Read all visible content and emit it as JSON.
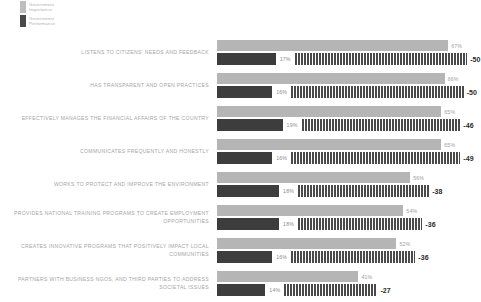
{
  "legend": {
    "items": [
      {
        "label": "Government\nImportance",
        "color": "#bdbdbd",
        "key": "importance"
      },
      {
        "label": "Government\nPerformance",
        "color": "#4a4a4a",
        "key": "performance"
      }
    ]
  },
  "chart_data": {
    "type": "bar",
    "title": "",
    "subtitle": "",
    "xlabel": "",
    "ylabel": "",
    "xlim": [
      0,
      70
    ],
    "grid": false,
    "legend_position": "top-left",
    "orientation": "horizontal",
    "value_suffix": "%",
    "categories": [
      "Listens to citizens' needs and feedback",
      "Has transparent and open practices",
      "Effectively manages the financial affairs of the country",
      "Communicates frequently and honestly",
      "Works to protect and improve the environment",
      "Provides national training programs to create employment opportunities",
      "Creates innovative programs that positively impact local communities",
      "Partners with business NGOs, and third parties to address societal issues"
    ],
    "series": [
      {
        "name": "Government Importance",
        "color": "#b5b5b5",
        "values": [
          67,
          66,
          65,
          65,
          56,
          54,
          52,
          41
        ]
      },
      {
        "name": "Government Performance",
        "color": "#3d3d3d",
        "values": [
          17,
          16,
          19,
          16,
          18,
          18,
          16,
          14
        ]
      },
      {
        "name": "Gap",
        "color": "#4a4a4a",
        "values": [
          -50,
          -50,
          -46,
          -49,
          -38,
          -36,
          -36,
          -27
        ]
      }
    ],
    "rows": [
      {
        "label": "LISTENS TO CITIZENS' NEEDS AND FEEDBACK",
        "importance": 67,
        "importance_label": "67%",
        "performance": 17,
        "performance_label": "17%",
        "gap": -50,
        "gap_label": "-50"
      },
      {
        "label": "HAS TRANSPARENT AND OPEN PRACTICES",
        "importance": 66,
        "importance_label": "66%",
        "performance": 16,
        "performance_label": "16%",
        "gap": -50,
        "gap_label": "-50"
      },
      {
        "label": "EFFECTIVELY MANAGES THE FINANCIAL AFFAIRS OF THE COUNTRY",
        "importance": 65,
        "importance_label": "65%",
        "performance": 19,
        "performance_label": "19%",
        "gap": -46,
        "gap_label": "-46"
      },
      {
        "label": "COMMUNICATES FREQUENTLY AND HONESTLY",
        "importance": 65,
        "importance_label": "65%",
        "performance": 16,
        "performance_label": "16%",
        "gap": -49,
        "gap_label": "-49"
      },
      {
        "label": "WORKS TO PROTECT AND IMPROVE THE ENVIRONMENT",
        "importance": 56,
        "importance_label": "56%",
        "performance": 18,
        "performance_label": "18%",
        "gap": -38,
        "gap_label": "-38"
      },
      {
        "label": "PROVIDES NATIONAL TRAINING PROGRAMS TO CREATE EMPLOYMENT OPPORTUNITIES",
        "importance": 54,
        "importance_label": "54%",
        "performance": 18,
        "performance_label": "18%",
        "gap": -36,
        "gap_label": "-36"
      },
      {
        "label": "CREATES INNOVATIVE PROGRAMS THAT POSITIVELY IMPACT LOCAL COMMUNITIES",
        "importance": 52,
        "importance_label": "52%",
        "performance": 16,
        "performance_label": "16%",
        "gap": -36,
        "gap_label": "-36"
      },
      {
        "label": "PARTNERS WITH BUSINESS NGOS, AND THIRD PARTIES TO ADDRESS SOCIETAL ISSUES",
        "importance": 41,
        "importance_label": "41%",
        "performance": 14,
        "performance_label": "14%",
        "gap": -27,
        "gap_label": "-27"
      }
    ]
  }
}
